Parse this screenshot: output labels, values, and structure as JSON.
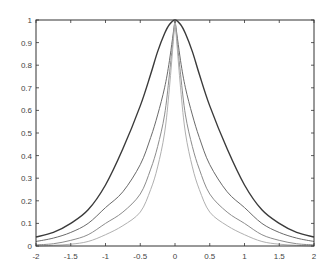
{
  "chart_data": {
    "type": "line",
    "title": "",
    "xlabel": "",
    "ylabel": "",
    "xlim": [
      -2,
      2
    ],
    "ylim": [
      0,
      1
    ],
    "grid": false,
    "legend": null,
    "x_ticks": [
      -2,
      -1.5,
      -1,
      -0.5,
      0,
      0.5,
      1,
      1.5,
      2
    ],
    "x_tick_labels": [
      "-2",
      "-1.5",
      "-1",
      "-0.5",
      "0",
      "0.5",
      "1",
      "1.5",
      "2"
    ],
    "y_ticks": [
      0,
      0.1,
      0.2,
      0.3,
      0.4,
      0.5,
      0.6,
      0.7,
      0.8,
      0.9,
      1
    ],
    "y_tick_labels": [
      "0",
      "0.1",
      "0.2",
      "0.3",
      "0.4",
      "0.5",
      "0.6",
      "0.7",
      "0.8",
      "0.9",
      "1"
    ],
    "x": [
      -2,
      -1.75,
      -1.5,
      -1.25,
      -1,
      -0.75,
      -0.5,
      -0.35,
      -0.25,
      -0.15,
      -0.08,
      0,
      0.08,
      0.15,
      0.25,
      0.35,
      0.5,
      0.75,
      1,
      1.25,
      1.5,
      1.75,
      2
    ],
    "series": [
      {
        "name": "curve-1",
        "color": "#3a3a3a",
        "values": [
          0.04,
          0.06,
          0.1,
          0.16,
          0.27,
          0.43,
          0.62,
          0.76,
          0.86,
          0.94,
          0.98,
          1.0,
          0.98,
          0.94,
          0.86,
          0.76,
          0.62,
          0.43,
          0.27,
          0.16,
          0.1,
          0.06,
          0.04
        ]
      },
      {
        "name": "curve-2",
        "color": "#6a6a6a",
        "values": [
          0.02,
          0.035,
          0.06,
          0.1,
          0.17,
          0.24,
          0.36,
          0.48,
          0.58,
          0.7,
          0.82,
          1.0,
          0.82,
          0.7,
          0.58,
          0.48,
          0.36,
          0.24,
          0.17,
          0.1,
          0.06,
          0.035,
          0.02
        ]
      },
      {
        "name": "curve-3",
        "color": "#8c8c8c",
        "values": [
          0.005,
          0.01,
          0.025,
          0.05,
          0.1,
          0.15,
          0.23,
          0.34,
          0.44,
          0.58,
          0.76,
          1.0,
          0.76,
          0.58,
          0.44,
          0.34,
          0.23,
          0.15,
          0.1,
          0.05,
          0.025,
          0.01,
          0.005
        ]
      },
      {
        "name": "curve-4",
        "color": "#b0b0b0",
        "values": [
          0.0,
          0.003,
          0.008,
          0.02,
          0.05,
          0.09,
          0.15,
          0.25,
          0.35,
          0.5,
          0.7,
          1.0,
          0.7,
          0.5,
          0.35,
          0.25,
          0.15,
          0.09,
          0.05,
          0.02,
          0.008,
          0.003,
          0.0
        ]
      }
    ]
  },
  "layout": {
    "plot_left": 36,
    "plot_top": 20,
    "plot_right": 314,
    "plot_bottom": 246
  }
}
